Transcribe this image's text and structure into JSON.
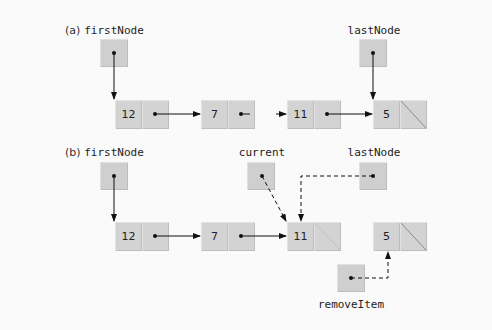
{
  "diagram": {
    "type": "linked-list-removal",
    "parts": [
      {
        "label": "(a)",
        "pointers": [
          {
            "name": "firstNode",
            "points_to": "12"
          },
          {
            "name": "lastNode",
            "points_to": "5"
          }
        ],
        "nodes": [
          {
            "value": "12",
            "next": "7"
          },
          {
            "value": "7",
            "next": "...(gap)"
          },
          {
            "value": "11",
            "next": "5"
          },
          {
            "value": "5",
            "next": "null"
          }
        ]
      },
      {
        "label": "(b)",
        "pointers": [
          {
            "name": "firstNode",
            "points_to": "12"
          },
          {
            "name": "current",
            "points_to": "11",
            "style": "dashed"
          },
          {
            "name": "lastNode",
            "points_to": "11",
            "style": "dashed"
          },
          {
            "name": "removeItem",
            "points_to": "5",
            "style": "dashed"
          }
        ],
        "nodes": [
          {
            "value": "12",
            "next": "7"
          },
          {
            "value": "7",
            "next": "11"
          },
          {
            "value": "11",
            "next": "null"
          },
          {
            "value": "5",
            "next": "null"
          }
        ]
      }
    ]
  },
  "a": {
    "label": "(a)",
    "first_node": "firstNode",
    "last_node": "lastNode",
    "nodes": [
      "12",
      "7",
      "11",
      "5"
    ]
  },
  "b": {
    "label": "(b)",
    "first_node": "firstNode",
    "current": "current",
    "last_node": "lastNode",
    "remove_item": "removeItem",
    "nodes": [
      "12",
      "7",
      "11",
      "5"
    ]
  },
  "colors": {
    "background": "#fafafa",
    "box_fill": "#d0d0d0",
    "line": "#111111"
  }
}
